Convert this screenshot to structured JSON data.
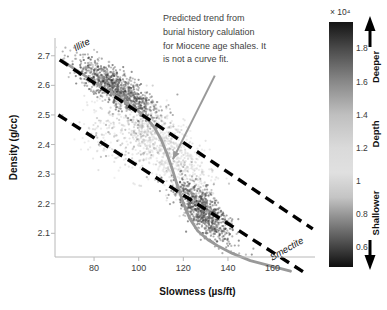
{
  "figure": {
    "background": "#ffffff"
  },
  "axes": {
    "xlabel": "Slowness (µs/ft)",
    "ylabel": "Density (g/cc)",
    "xlim": [
      62.5,
      179
    ],
    "ylim": [
      2.02,
      2.76
    ],
    "xticks": [
      {
        "v": 80,
        "label": "80"
      },
      {
        "v": 100,
        "label": "100"
      },
      {
        "v": 120,
        "label": "120"
      },
      {
        "v": 140,
        "label": "140"
      },
      {
        "v": 160,
        "label": "160"
      }
    ],
    "yticks": [
      {
        "v": 2.1,
        "label": "2.1"
      },
      {
        "v": 2.2,
        "label": "2.2"
      },
      {
        "v": 2.3,
        "label": "2.3"
      },
      {
        "v": 2.4,
        "label": "2.4"
      },
      {
        "v": 2.5,
        "label": "2.5"
      },
      {
        "v": 2.6,
        "label": "2.6"
      },
      {
        "v": 2.7,
        "label": "2.7"
      }
    ],
    "spine_color": "#b8b8b8",
    "tick_color": "#b8b8b8"
  },
  "annotation": {
    "text": "Predicted trend from\nburial history calulation\nfor Miocene age shales. It\nis not a curve fit.",
    "color": "#3f3f3f"
  },
  "labels": {
    "illite": "Illite",
    "smectite": "Smectite"
  },
  "colorbar": {
    "exponent": "× 10⁴",
    "value_range": [
      0.48,
      1.96
    ],
    "ticks": [
      {
        "v": 1.8,
        "label": "1.8"
      },
      {
        "v": 1.6,
        "label": "1.6"
      },
      {
        "v": 1.4,
        "label": "1.4"
      },
      {
        "v": 1.2,
        "label": "1.2"
      },
      {
        "v": 1.0,
        "label": "1"
      },
      {
        "v": 0.8,
        "label": "0.8"
      },
      {
        "v": 0.6,
        "label": "0.6"
      }
    ],
    "deeper": "Deeper",
    "depth": "Depth",
    "shallower": "Shallower",
    "arrow_color": "#000000"
  },
  "chart_data": {
    "type": "scatter",
    "title": "",
    "xlabel": "Slowness (µs/ft)",
    "ylabel": "Density (g/cc)",
    "xlim": [
      62.5,
      179
    ],
    "ylim": [
      2.02,
      2.76
    ],
    "grid": false,
    "color_variable": "Depth (ft × 10⁴)",
    "colormap_stops": [
      [
        1.96,
        "#141414"
      ],
      [
        1.8,
        "#4a4a4a"
      ],
      [
        1.6,
        "#888888"
      ],
      [
        1.4,
        "#bfbfbf"
      ],
      [
        1.2,
        "#dadada"
      ],
      [
        1.05,
        "#e0e0e0"
      ],
      [
        0.9,
        "#c4c4c4"
      ],
      [
        0.8,
        "#989898"
      ],
      [
        0.6,
        "#434343"
      ],
      [
        0.48,
        "#0e0e0e"
      ]
    ],
    "point_clusters": [
      {
        "name": "sparse-mid-depth-fringe",
        "n": 300,
        "center": [
          94,
          2.42
        ],
        "slope": -0.003,
        "spread": [
          11,
          0.065
        ],
        "depth_mean": 1.3,
        "depth_sd": 0.22
      },
      {
        "name": "transition-band",
        "n": 750,
        "path_from": [
          99,
          2.505
        ],
        "path_to": [
          128,
          2.26
        ],
        "spread": [
          5,
          0.05
        ],
        "depth_from": 1.45,
        "depth_to": 0.92,
        "depth_sd": 0.12
      },
      {
        "name": "illite-rich-deep-shales",
        "n": 950,
        "center": [
          90,
          2.59
        ],
        "slope": -0.0045,
        "spread": [
          9,
          0.03
        ],
        "depth_mean": 1.72,
        "depth_sd": 0.13
      },
      {
        "name": "smectite-rich-shallow-shales",
        "n": 800,
        "center": [
          129,
          2.175
        ],
        "slope": -0.006,
        "spread": [
          6.5,
          0.035
        ],
        "depth_mean": 0.66,
        "depth_sd": 0.1
      }
    ],
    "marker": {
      "radius_px": 1.1,
      "opacity": 0.5
    },
    "illite_line": {
      "style": "dashed",
      "color": "#000000",
      "from": [
        64.6,
        2.686
      ],
      "to": [
        178,
        2.115
      ]
    },
    "smectite_line": {
      "style": "dashed",
      "color": "#000000",
      "from": [
        64,
        2.5
      ],
      "to": [
        174.5,
        1.966
      ]
    },
    "trend_line": {
      "style": "solid",
      "color": "#999999",
      "points": [
        [
          66,
          2.682
        ],
        [
          76,
          2.632
        ],
        [
          85,
          2.588
        ],
        [
          93,
          2.548
        ],
        [
          99,
          2.518
        ],
        [
          103.5,
          2.49
        ],
        [
          107,
          2.458
        ],
        [
          110,
          2.418
        ],
        [
          112.5,
          2.372
        ],
        [
          115,
          2.318
        ],
        [
          117.5,
          2.258
        ],
        [
          120,
          2.202
        ],
        [
          123,
          2.148
        ],
        [
          126.5,
          2.108
        ],
        [
          131,
          2.078
        ],
        [
          136,
          2.055
        ],
        [
          142,
          2.032
        ],
        [
          150,
          2.008
        ],
        [
          159,
          1.99
        ],
        [
          168,
          1.972
        ]
      ]
    },
    "annotation_arrow": {
      "color": "#999999",
      "from": [
        134.1,
        2.633
      ],
      "to": [
        115.3,
        2.35
      ]
    }
  }
}
